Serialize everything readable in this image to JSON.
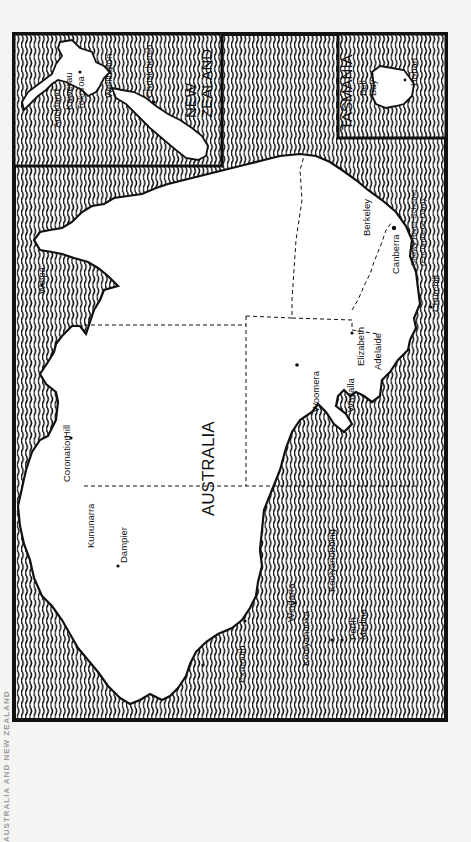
{
  "page": {
    "running_header": "AUSTRALIA AND NEW ZEALAND",
    "orientation": "rotated 90° clockwise (north to the left)"
  },
  "insets": {
    "new_zealand": {
      "title_line1": "NEW",
      "title_line2": "ZEALAND",
      "places": {
        "auckland": "Auckland",
        "kawerau": "Kawerau",
        "tokoroa": "Tokoroa",
        "wellington": "Wellington",
        "christchurch": "Christchurch"
      }
    },
    "tasmania": {
      "title": "TASMANIA",
      "places": {
        "bell_bay_1": "Bell",
        "bell_bay_2": "Bay",
        "hobart": "Hobart"
      }
    }
  },
  "main_map": {
    "title": "AUSTRALIA",
    "places": {
      "weipa": "Weipa",
      "coronation_hill": "Coronation",
      "coronation_hill_2": "Hill",
      "kununurra": "Kununarra",
      "dampier": "Dampier",
      "exmouth": "Exmouth",
      "koolyanooka": "Koolyanooka",
      "windarra": "Windarra",
      "koolyanobbing": "Koolyanobbing",
      "perth": "Perth",
      "medina": "Medina",
      "woomera": "Woomera",
      "whyalla": "Whyalla",
      "elizabeth": "Elizabeth",
      "adelaide": "Adelaide",
      "canberra": "Canberra",
      "berkeley": "Berkeley",
      "snowy_river_1": "Snowy River Scheme",
      "snowy_river_2": "(Encumbene Dam)",
      "churchill": "Churchill"
    }
  },
  "colors": {
    "ink": "#111111",
    "paper": "#f4f4f2",
    "land": "#ffffff"
  }
}
